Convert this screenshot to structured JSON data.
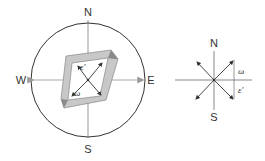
{
  "left_diagram": {
    "labels": {
      "north": "N",
      "south": "S",
      "west": "W",
      "east": "E"
    },
    "symbols": {
      "epsilon": "ε'",
      "omega": "ω"
    }
  },
  "right_diagram": {
    "labels": {
      "north": "N",
      "south": "S"
    },
    "symbols": {
      "omega": "ω",
      "epsilon": "ε'"
    }
  },
  "colors": {
    "line": "#333333",
    "arrow_gray": "#999999",
    "frame_fill": "#c8c8c8",
    "frame_dark": "#8a8a8a"
  }
}
